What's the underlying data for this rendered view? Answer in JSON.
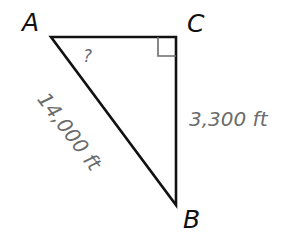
{
  "diagram": {
    "type": "right-triangle",
    "vertices": {
      "A": {
        "label": "A",
        "x": 51,
        "y": 37
      },
      "C": {
        "label": "C",
        "x": 176,
        "y": 37
      },
      "B": {
        "label": "B",
        "x": 176,
        "y": 205
      }
    },
    "right_angle_at": "C",
    "sides": {
      "AB": {
        "label": "14,000 ft",
        "role": "hypotenuse"
      },
      "CB": {
        "label": "3,300 ft",
        "role": "leg"
      },
      "AC": {
        "label": "",
        "role": "leg"
      }
    },
    "unknown_angle": {
      "at": "A",
      "label": "?"
    },
    "colors": {
      "stroke": "#111111",
      "right_angle_marker": "#6b6b6b",
      "measure_text": "#6b6b6b",
      "vertex_text": "#111111"
    }
  }
}
